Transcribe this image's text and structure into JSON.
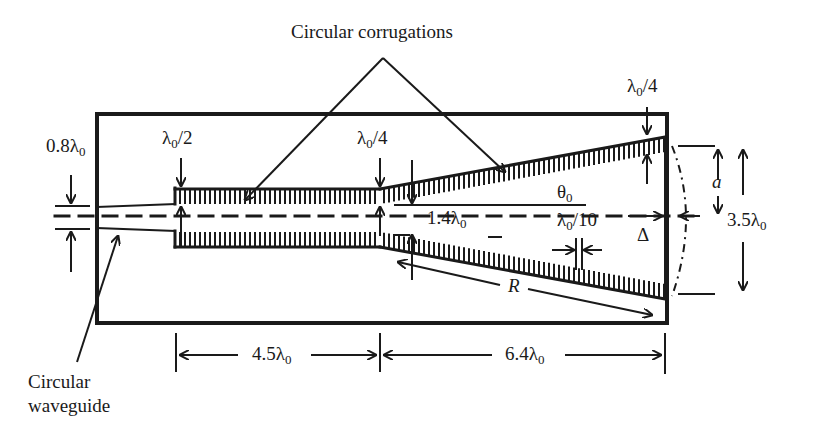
{
  "diagram": {
    "labels": {
      "circular_corrugations": "Circular corrugations",
      "circular_waveguide_line1": "Circular",
      "circular_waveguide_line2": "waveguide",
      "wg_diameter": "0.8λ",
      "wg_diameter_sub": "0",
      "depth_half": "λ",
      "depth_half_sub": "0",
      "depth_half_tail": "/2",
      "depth_quarter_mid": "λ",
      "depth_quarter_mid_sub": "0",
      "depth_quarter_mid_tail": "/4",
      "depth_quarter_aperture": "λ",
      "depth_quarter_aperture_sub": "0",
      "depth_quarter_aperture_tail": "/4",
      "throat_diameter": "1.4λ",
      "throat_diameter_sub": "0",
      "pitch": "λ",
      "pitch_sub": "0",
      "pitch_tail": "/10",
      "flare_angle": "θ",
      "flare_angle_sub": "0",
      "slant_length": "R",
      "aperture_radius": "a",
      "phase_error": "Δ",
      "aperture_diameter": "3.5λ",
      "aperture_diameter_sub": "0",
      "section1_length": "4.5λ",
      "section1_length_sub": "0",
      "section2_length": "6.4λ",
      "section2_length_sub": "0"
    },
    "colors": {
      "ink": "#1a1a1a",
      "background": "#ffffff"
    }
  }
}
